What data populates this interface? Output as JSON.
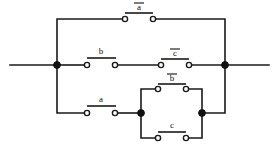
{
  "diagram": {
    "type": "switching-circuit",
    "width": 279,
    "height": 149,
    "line_color": "#1a1a1a",
    "node_color": "#111111",
    "background": "#ffffff"
  },
  "terminals": {
    "left": {
      "label": "",
      "x": 10,
      "y": 65
    },
    "right": {
      "label": "",
      "x": 269,
      "y": 65
    }
  },
  "nodes": [
    {
      "name": "left-terminal-node",
      "x": 57,
      "y": 65
    },
    {
      "name": "right-terminal-node",
      "x": 225,
      "y": 65
    },
    {
      "name": "inner-left-node",
      "x": 141,
      "y": 113
    },
    {
      "name": "inner-right-node",
      "x": 202,
      "y": 113
    }
  ],
  "switches": [
    {
      "id": "sw-a-bar-top",
      "label": "a",
      "negated": true,
      "display": "ā",
      "branch": "top",
      "cx": 139,
      "cy": 19,
      "label_x": 139,
      "label_y": 10
    },
    {
      "id": "sw-b-middle",
      "label": "b",
      "negated": false,
      "display": "b",
      "branch": "middle",
      "cx": 101,
      "cy": 65,
      "label_x": 101,
      "label_y": 54
    },
    {
      "id": "sw-c-bar-middle",
      "label": "c",
      "negated": true,
      "display": "c̄",
      "branch": "middle",
      "cx": 175,
      "cy": 65,
      "label_x": 175,
      "label_y": 56
    },
    {
      "id": "sw-a-bottom",
      "label": "a",
      "negated": false,
      "display": "a",
      "branch": "bottom",
      "cx": 101,
      "cy": 113,
      "label_x": 101,
      "label_y": 102
    },
    {
      "id": "sw-b-bar-inner",
      "label": "b",
      "negated": true,
      "display": "b̄",
      "branch": "inner-upper",
      "cx": 172,
      "cy": 89,
      "label_x": 172,
      "label_y": 81
    },
    {
      "id": "sw-c-inner",
      "label": "c",
      "negated": false,
      "display": "c",
      "branch": "inner-lower",
      "cx": 172,
      "cy": 138,
      "label_x": 172,
      "label_y": 128
    }
  ],
  "legend": {
    "contact_symbol": "open-circle-terminal",
    "junction_symbol": "filled-dot",
    "blade_symbol": "horizontal-bar"
  }
}
